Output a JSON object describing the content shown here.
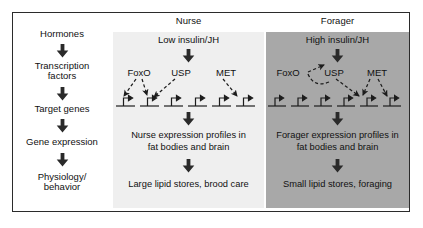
{
  "figure": {
    "type": "diagram",
    "border_color": "#2b2b2b",
    "background": "#ffffff"
  },
  "left_column": {
    "name": "gene-regulation-pathway",
    "steps": [
      {
        "label": "Hormones"
      },
      {
        "label": "Transcription\nfactors"
      },
      {
        "label": "Target genes"
      },
      {
        "label": "Gene expression"
      },
      {
        "label": "Physiology/\nbehavior"
      }
    ],
    "connector_icon": "down-block-arrow"
  },
  "panels": [
    {
      "id": "nurse",
      "title": "Nurse",
      "background": "#efefef",
      "signal": "Low insulin/JH",
      "transcription_factors": [
        {
          "name": "FoxO"
        },
        {
          "name": "USP"
        },
        {
          "name": "MET"
        }
      ],
      "gene_count": 6,
      "activated_genes": [
        1,
        2,
        6
      ],
      "expression_text": "Nurse expression profiles in\nfat bodies and brain",
      "outcome_text": "Large lipid stores, brood care"
    },
    {
      "id": "forager",
      "title": "Forager",
      "background": "#a8a8a8",
      "signal": "High insulin/JH",
      "transcription_factors": [
        {
          "name": "FoxO"
        },
        {
          "name": "USP"
        },
        {
          "name": "MET"
        }
      ],
      "gene_count": 6,
      "activated_genes": [
        5,
        6
      ],
      "expression_text": "Forager expression profiles in\nfat bodies and brain",
      "outcome_text": "Small lipid stores, foraging"
    }
  ],
  "icons": {
    "block_arrow": "down-block-arrow",
    "dashed_arrow": "dashed-regulatory-arrow",
    "gene_symbol": "promoter-bent-arrow"
  }
}
